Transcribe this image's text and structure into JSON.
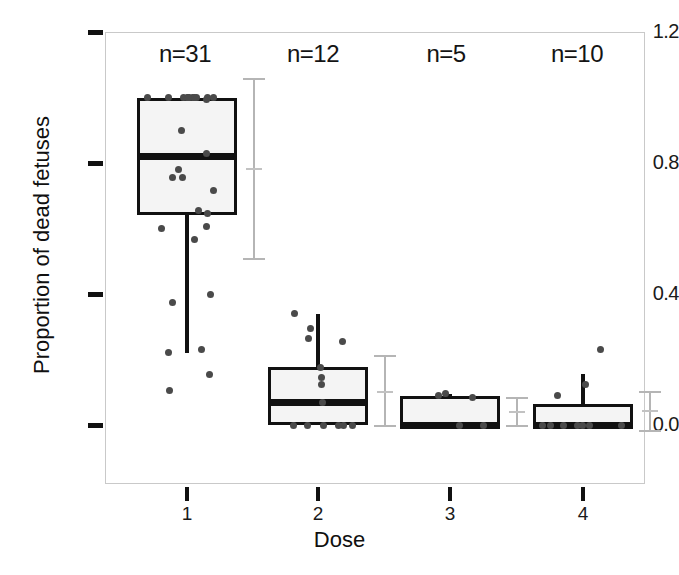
{
  "figure": {
    "xlabel": "Dose",
    "ylabel": "Proportion of dead fetuses"
  },
  "axis": {
    "y_ticks": [
      "1.2",
      "0.8",
      "0.4",
      "0.0"
    ],
    "x_ticks": [
      "1",
      "2",
      "3",
      "4"
    ]
  },
  "annotations": {
    "counts": [
      "n=31",
      "n=12",
      "n=5",
      "n=10"
    ]
  },
  "chart_data": {
    "type": "box",
    "title": "",
    "xlabel": "Dose",
    "ylabel": "Proportion of dead fetuses",
    "ylim": [
      -0.1,
      1.2
    ],
    "yticks": [
      0.0,
      0.4,
      0.8,
      1.2
    ],
    "xticks": [
      1,
      2,
      3,
      4
    ],
    "grid": true,
    "legend": "none",
    "categories": [
      "1",
      "2",
      "3",
      "4"
    ],
    "counts": [
      31,
      12,
      5,
      10
    ],
    "boxes": [
      {
        "dose": 1,
        "n": 31,
        "q1": 0.64,
        "median": 0.82,
        "q3": 1.0,
        "whisker_low": 0.22,
        "whisker_high": 1.0,
        "ci_low": 0.51,
        "ci_mean": 0.785,
        "ci_high": 1.06,
        "points": [
          0.995,
          1.0,
          1.0,
          1.0,
          1.0,
          1.0,
          1.0,
          1.0,
          1.0,
          1.0,
          1.0,
          1.0,
          0.9,
          0.83,
          0.78,
          0.755,
          0.755,
          0.715,
          0.655,
          0.645,
          0.605,
          0.6,
          0.565,
          0.4,
          0.375,
          0.23,
          0.22,
          0.155,
          0.105
        ]
      },
      {
        "dose": 2,
        "n": 12,
        "q1": 0.0,
        "median": 0.07,
        "q3": 0.178,
        "whisker_low": 0.0,
        "whisker_high": 0.34,
        "ci_low": 0.0,
        "ci_mean": 0.105,
        "ci_high": 0.215,
        "points": [
          0.34,
          0.295,
          0.265,
          0.255,
          0.175,
          0.145,
          0.125,
          0.07,
          0.0,
          0.0,
          0.0,
          0.0,
          0.0,
          0.0
        ]
      },
      {
        "dose": 3,
        "n": 5,
        "q1": 0.0,
        "median": 0.0,
        "q3": 0.088,
        "whisker_low": 0.0,
        "whisker_high": 0.095,
        "ci_low": 0.0,
        "ci_mean": 0.042,
        "ci_high": 0.085,
        "points": [
          0.095,
          0.09,
          0.085,
          0.0,
          0.0
        ]
      },
      {
        "dose": 4,
        "n": 10,
        "q1": 0.0,
        "median": 0.0,
        "q3": 0.065,
        "whisker_low": 0.0,
        "whisker_high": 0.155,
        "ci_low": -0.015,
        "ci_mean": 0.045,
        "ci_high": 0.105,
        "points": [
          0.23,
          0.125,
          0.09,
          0.0,
          0.0,
          0.0,
          0.0,
          0.0,
          0.0,
          0.0
        ]
      }
    ]
  }
}
